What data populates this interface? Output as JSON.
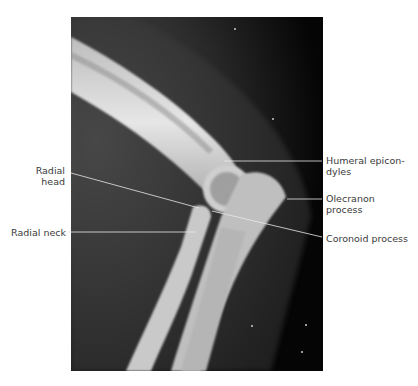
{
  "figure": {
    "labels": {
      "radial_head": {
        "line1": "Radial",
        "line2": "head"
      },
      "radial_neck": "Radial neck",
      "humeral_epicondyles": {
        "line1": "Humeral epicon-",
        "line2": "dyles"
      },
      "olecranon_process": {
        "line1": "Olecranon",
        "line2": "process"
      },
      "coronoid_process": "Coronoid process"
    },
    "colors": {
      "background": "#ffffff",
      "xray_dark": "#0a0a0a",
      "bone": "#d8d8d8",
      "label_text": "#3a3a3a",
      "leader_line": "#e8e8e8"
    }
  }
}
